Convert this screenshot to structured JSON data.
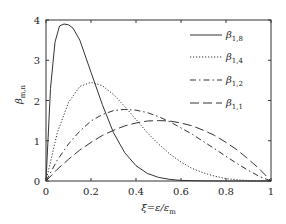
{
  "chart_data": {
    "type": "line",
    "title": "",
    "xlabel": "ξ=ε/ε_m",
    "ylabel": "β_{m,n}",
    "xlim": [
      0,
      1
    ],
    "ylim": [
      0,
      4
    ],
    "xticks": [
      0,
      0.2,
      0.4,
      0.6,
      0.8,
      1
    ],
    "xtick_labels": [
      "0",
      "0.2",
      "0.4",
      "0.6",
      "0.8",
      "1"
    ],
    "yticks": [
      0,
      1,
      2,
      3,
      4
    ],
    "ytick_labels": [
      "0",
      "1",
      "2",
      "3",
      "4"
    ],
    "grid": false,
    "legend_position": "upper right",
    "series": [
      {
        "name": "β_{1,8}",
        "label_main": "β",
        "label_sub": "1,8",
        "style": "solid",
        "x": [
          0,
          0.02,
          0.04,
          0.06,
          0.08,
          0.1,
          0.12,
          0.15,
          0.2,
          0.25,
          0.3,
          0.35,
          0.4,
          0.45,
          0.5,
          0.55,
          0.6,
          0.7,
          0.8,
          0.9,
          1
        ],
        "values": [
          0,
          2.3,
          3.45,
          3.85,
          3.9,
          3.88,
          3.8,
          3.5,
          2.7,
          1.9,
          1.2,
          0.7,
          0.38,
          0.19,
          0.09,
          0.04,
          0.015,
          0.003,
          0,
          0,
          0
        ]
      },
      {
        "name": "β_{1,4}",
        "label_main": "β",
        "label_sub": "1,4",
        "style": "dotted",
        "x": [
          0,
          0.05,
          0.1,
          0.15,
          0.2,
          0.25,
          0.3,
          0.35,
          0.4,
          0.45,
          0.5,
          0.55,
          0.6,
          0.65,
          0.7,
          0.75,
          0.8,
          0.85,
          0.9,
          0.95,
          1
        ],
        "values": [
          0,
          1.2,
          1.95,
          2.35,
          2.45,
          2.37,
          2.15,
          1.85,
          1.53,
          1.2,
          0.92,
          0.67,
          0.47,
          0.31,
          0.2,
          0.12,
          0.06,
          0.03,
          0.01,
          0.002,
          0
        ]
      },
      {
        "name": "β_{1,2}",
        "label_main": "β",
        "label_sub": "1,2",
        "style": "dashdot",
        "x": [
          0,
          0.05,
          0.1,
          0.15,
          0.2,
          0.25,
          0.3,
          0.35,
          0.4,
          0.45,
          0.5,
          0.55,
          0.6,
          0.65,
          0.7,
          0.75,
          0.8,
          0.85,
          0.9,
          0.95,
          1
        ],
        "values": [
          0,
          0.52,
          0.92,
          1.24,
          1.49,
          1.65,
          1.75,
          1.78,
          1.76,
          1.7,
          1.6,
          1.47,
          1.32,
          1.16,
          0.98,
          0.8,
          0.61,
          0.43,
          0.26,
          0.11,
          0
        ]
      },
      {
        "name": "β_{1,1}",
        "label_main": "β",
        "label_sub": "1,1",
        "style": "longdash",
        "x": [
          0,
          0.05,
          0.1,
          0.15,
          0.2,
          0.25,
          0.3,
          0.35,
          0.4,
          0.45,
          0.5,
          0.55,
          0.6,
          0.65,
          0.7,
          0.75,
          0.8,
          0.85,
          0.9,
          0.95,
          1
        ],
        "values": [
          0,
          0.29,
          0.54,
          0.77,
          0.96,
          1.13,
          1.26,
          1.37,
          1.44,
          1.49,
          1.5,
          1.49,
          1.44,
          1.37,
          1.26,
          1.13,
          0.96,
          0.77,
          0.54,
          0.29,
          0
        ]
      }
    ]
  },
  "colors": {
    "line": "#333333",
    "axis": "#333333",
    "background": "#ffffff"
  }
}
